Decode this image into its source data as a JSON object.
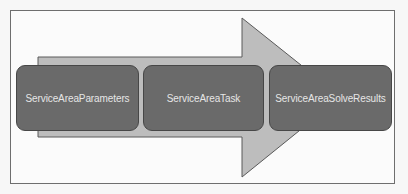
{
  "diagram": {
    "type": "process-flow",
    "steps": [
      {
        "label": "ServiceAreaParameters"
      },
      {
        "label": "ServiceAreaTask"
      },
      {
        "label": "ServiceAreaSolveResults"
      }
    ],
    "colors": {
      "frame_border": "#6e6e6e",
      "arrow_fill": "#bdbdbd",
      "arrow_stroke": "#5a5a5a",
      "box_fill": "#6a6a6a",
      "box_border": "#474747",
      "box_text": "#e6e6e6"
    }
  }
}
